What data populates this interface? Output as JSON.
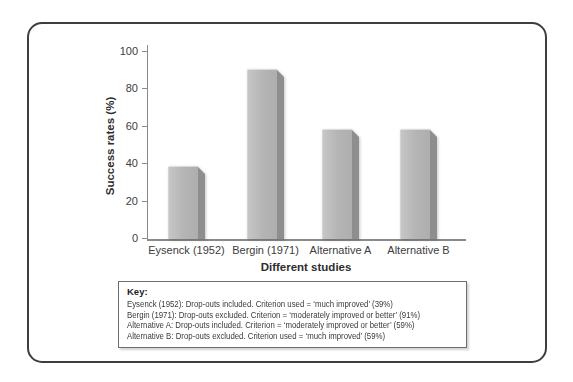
{
  "chart_data": {
    "type": "bar",
    "categories": [
      "Eysenck (1952)",
      "Bergin (1971)",
      "Alternative A",
      "Alternative B"
    ],
    "values": [
      39,
      91,
      59,
      59
    ],
    "xlabel": "Different studies",
    "ylabel": "Success rates (%)",
    "ylim": [
      0,
      100
    ],
    "yticks": [
      0,
      20,
      40,
      60,
      80,
      100
    ],
    "grid": false,
    "legend_position": "none",
    "bar_face_color": "#b4b4b4",
    "bar_side_color": "#8e8e8e",
    "axis_color": "#8a8a8a"
  },
  "key_box": {
    "heading": "Key:",
    "lines": [
      "Eysenck (1952): Drop-outs included. Criterion used = ‘much improved’ (39%)",
      "Bergin (1971): Drop-outs excluded. Criterion = ‘moderately improved or better’ (91%)",
      "Alternative A: Drop-outs included. Criterion = ‘moderately improved or better’ (59%)",
      "Alternative B: Drop-outs excluded. Criterion used = ‘much improved’ (59%)"
    ]
  }
}
